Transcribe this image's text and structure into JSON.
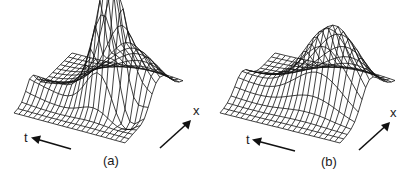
{
  "figure": {
    "panels": [
      {
        "id": "a",
        "caption": "(a)",
        "axis_t_label": "t",
        "axis_x_label": "x",
        "description": "3D wireframe surface with a sharp tall peak near the center and a trough in front"
      },
      {
        "id": "b",
        "caption": "(b)",
        "axis_t_label": "t",
        "axis_x_label": "x",
        "description": "3D wireframe surface with a smoother, lower broad ridge"
      }
    ],
    "line_color": "#111111",
    "background": "#ffffff",
    "cut_caption_text": ""
  }
}
